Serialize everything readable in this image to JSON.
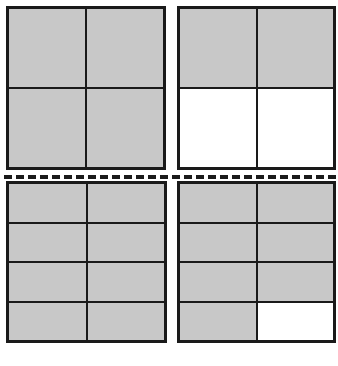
{
  "colors": {
    "shaded": "#c8c8c8",
    "unshaded": "#ffffff",
    "line": "#1a1a1a"
  },
  "panels": [
    {
      "id": "top-left",
      "rows": 2,
      "cols": 2,
      "cells": [
        1,
        1,
        1,
        1
      ],
      "shaded_count": 4,
      "total": 4
    },
    {
      "id": "top-right",
      "rows": 2,
      "cols": 2,
      "cells": [
        1,
        1,
        0,
        0
      ],
      "shaded_count": 2,
      "total": 4
    },
    {
      "id": "bottom-left",
      "rows": 4,
      "cols": 2,
      "cells": [
        1,
        1,
        1,
        1,
        1,
        1,
        1,
        1
      ],
      "shaded_count": 8,
      "total": 8
    },
    {
      "id": "bottom-right",
      "rows": 4,
      "cols": 2,
      "cells": [
        1,
        1,
        1,
        1,
        1,
        1,
        1,
        0
      ],
      "shaded_count": 7,
      "total": 8
    }
  ],
  "divider": {
    "style": "dashed",
    "orientation": "horizontal"
  }
}
